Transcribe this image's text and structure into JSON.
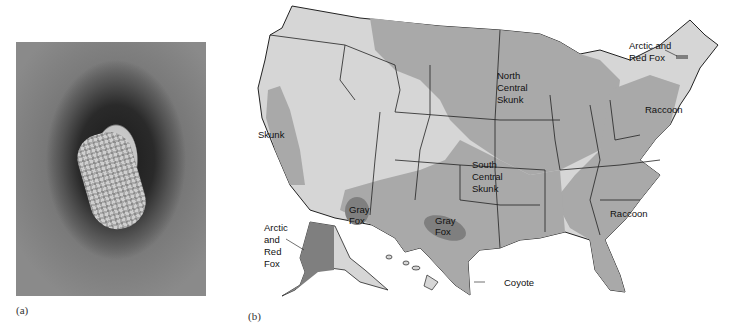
{
  "panel_a": {
    "caption": "(a)",
    "description": "electron micrograph of rabies virus particle"
  },
  "panel_b": {
    "caption": "(b)",
    "title": "Rabies reservoirs in the United States",
    "labels": {
      "arctic_red_fox_ne": [
        "Arctic and",
        "Red Fox"
      ],
      "north_central_skunk": [
        "North",
        "Central",
        "Skunk"
      ],
      "raccoon_ne": "Raccoon",
      "skunk_ca": "Skunk",
      "south_central_skunk": [
        "South",
        "Central",
        "Skunk"
      ],
      "gray_fox_az": [
        "Gray",
        "Fox"
      ],
      "gray_fox_tx": [
        "Gray",
        "Fox"
      ],
      "raccoon_se": "Raccoon",
      "arctic_red_fox_ak": [
        "Arctic",
        "and",
        "Red",
        "Fox"
      ],
      "coyote": "Coyote"
    },
    "colors": {
      "land_light": "#d6d6d6",
      "reservoir_medium": "#a9a9a9",
      "reservoir_dark": "#7f7f7f",
      "border": "#222222",
      "background": "#ffffff"
    }
  }
}
